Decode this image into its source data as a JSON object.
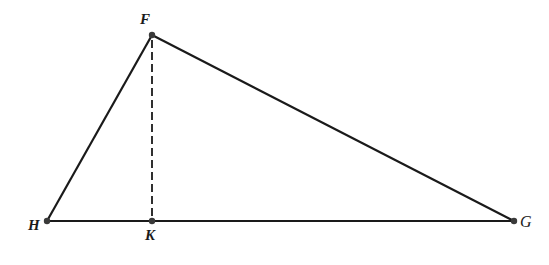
{
  "diagram": {
    "type": "geometry-triangle",
    "colors": {
      "stroke": "#1a1a1a",
      "point": "#3a3a3a",
      "background": "#ffffff"
    },
    "points": {
      "F": {
        "label": "F",
        "x": 152,
        "y": 35
      },
      "H": {
        "label": "H",
        "x": 47,
        "y": 221
      },
      "K": {
        "label": "K",
        "x": 152,
        "y": 221
      },
      "G": {
        "label": "G",
        "x": 514,
        "y": 221
      }
    },
    "segments": [
      {
        "from": "F",
        "to": "H",
        "style": "solid"
      },
      {
        "from": "F",
        "to": "G",
        "style": "solid"
      },
      {
        "from": "H",
        "to": "G",
        "style": "solid"
      },
      {
        "from": "F",
        "to": "K",
        "style": "dashed"
      }
    ]
  }
}
